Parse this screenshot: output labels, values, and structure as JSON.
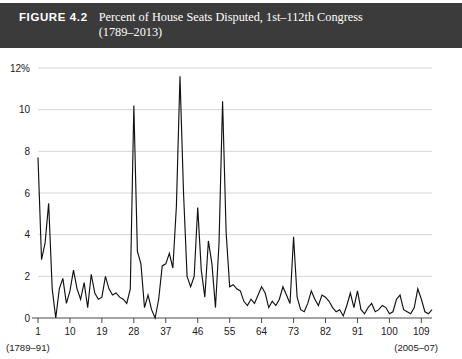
{
  "figure": {
    "label": "FIGURE 4.2",
    "title_line1": "Percent of House Seats Disputed, 1st–112th Congress",
    "title_line2": "(1789–2013)",
    "header_bg": "#3b3b3b",
    "header_fg": "#ffffff"
  },
  "chart_data": {
    "type": "line",
    "title": "Percent of House Seats Disputed, 1st–112th Congress (1789–2013)",
    "xlabel": "",
    "ylabel": "",
    "grid": true,
    "legend": "none",
    "line_color": "#111111",
    "grid_color": "#c9c9c9",
    "xlim": [
      1,
      112
    ],
    "ylim": [
      0,
      12
    ],
    "ytick_labels": [
      "12%",
      "10",
      "8",
      "6",
      "4",
      "2",
      "0"
    ],
    "yticks": [
      12,
      10,
      8,
      6,
      4,
      2,
      0
    ],
    "xticks": [
      1,
      10,
      19,
      28,
      37,
      46,
      55,
      64,
      73,
      82,
      91,
      100,
      109
    ],
    "xtick_labels": [
      "1",
      "10",
      "19",
      "28",
      "37",
      "46",
      "55",
      "64",
      "73",
      "82",
      "91",
      "100",
      "109"
    ],
    "x_left_note": "(1789–91)",
    "x_right_note": "(2005–07)",
    "x": [
      1,
      2,
      3,
      4,
      5,
      6,
      7,
      8,
      9,
      10,
      11,
      12,
      13,
      14,
      15,
      16,
      17,
      18,
      19,
      20,
      21,
      22,
      23,
      24,
      25,
      26,
      27,
      28,
      29,
      30,
      31,
      32,
      33,
      34,
      35,
      36,
      37,
      38,
      39,
      40,
      41,
      42,
      43,
      44,
      45,
      46,
      47,
      48,
      49,
      50,
      51,
      52,
      53,
      54,
      55,
      56,
      57,
      58,
      59,
      60,
      61,
      62,
      63,
      64,
      65,
      66,
      67,
      68,
      69,
      70,
      71,
      72,
      73,
      74,
      75,
      76,
      77,
      78,
      79,
      80,
      81,
      82,
      83,
      84,
      85,
      86,
      87,
      88,
      89,
      90,
      91,
      92,
      93,
      94,
      95,
      96,
      97,
      98,
      99,
      100,
      101,
      102,
      103,
      104,
      105,
      106,
      107,
      108,
      109,
      110,
      111,
      112
    ],
    "values": [
      7.7,
      2.8,
      3.6,
      5.5,
      1.4,
      0.0,
      1.4,
      1.9,
      0.7,
      1.3,
      2.3,
      1.4,
      0.9,
      1.7,
      0.5,
      2.1,
      1.2,
      0.9,
      1.0,
      2.0,
      1.4,
      1.1,
      1.2,
      1.0,
      0.9,
      0.7,
      1.4,
      10.2,
      3.2,
      2.6,
      0.5,
      1.1,
      0.4,
      0.0,
      0.9,
      2.5,
      2.6,
      3.1,
      2.4,
      5.4,
      11.6,
      6.0,
      2.0,
      1.5,
      2.0,
      5.3,
      2.3,
      1.0,
      3.7,
      2.6,
      0.5,
      3.6,
      10.4,
      4.1,
      1.5,
      1.6,
      1.4,
      1.3,
      0.8,
      0.6,
      0.9,
      0.7,
      1.1,
      1.5,
      1.2,
      0.5,
      0.8,
      0.6,
      0.9,
      1.5,
      1.1,
      0.7,
      3.9,
      1.0,
      0.4,
      0.3,
      0.7,
      1.3,
      0.9,
      0.6,
      1.1,
      1.0,
      0.8,
      0.5,
      0.3,
      0.4,
      0.1,
      0.6,
      1.2,
      0.5,
      1.3,
      0.4,
      0.2,
      0.5,
      0.7,
      0.3,
      0.4,
      0.6,
      0.5,
      0.2,
      0.3,
      0.9,
      1.1,
      0.4,
      0.3,
      0.2,
      0.5,
      1.4,
      0.9,
      0.3,
      0.2,
      0.4
    ]
  }
}
